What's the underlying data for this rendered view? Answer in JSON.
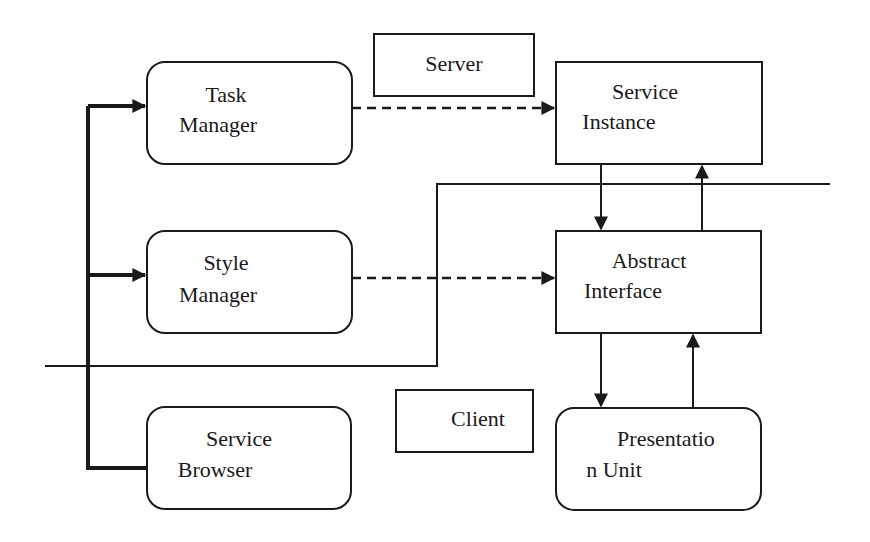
{
  "diagram": {
    "type": "client-server architecture",
    "colors": {
      "stroke": "#1a1a1a",
      "background": "#ffffff"
    },
    "zones": {
      "server_label": "Server",
      "client_label": "Client"
    },
    "nodes": {
      "task_manager": {
        "line1": "Task",
        "line2": "Manager",
        "shape": "rounded-rect"
      },
      "style_manager": {
        "line1": "Style",
        "line2": "Manager",
        "shape": "rounded-rect"
      },
      "service_browser": {
        "line1": "Service",
        "line2": "Browser",
        "shape": "rounded-rect"
      },
      "service_instance": {
        "line1": "Service",
        "line2": "Instance",
        "shape": "rect"
      },
      "abstract_interface": {
        "line1": "Abstract",
        "line2": "Interface",
        "shape": "rect"
      },
      "presentation_unit": {
        "line1": "Presentatio",
        "line2": "n Unit",
        "shape": "rounded-rect"
      }
    },
    "edges": [
      {
        "from": "service_browser",
        "to": "task_manager",
        "style": "thick-solid"
      },
      {
        "from": "service_browser",
        "to": "style_manager",
        "style": "thick-solid"
      },
      {
        "from": "task_manager",
        "to": "service_instance",
        "style": "dashed"
      },
      {
        "from": "style_manager",
        "to": "abstract_interface",
        "style": "dashed"
      },
      {
        "from": "service_instance",
        "to": "abstract_interface",
        "style": "solid"
      },
      {
        "from": "abstract_interface",
        "to": "service_instance",
        "style": "solid"
      },
      {
        "from": "abstract_interface",
        "to": "presentation_unit",
        "style": "solid"
      },
      {
        "from": "presentation_unit",
        "to": "abstract_interface",
        "style": "solid"
      }
    ]
  }
}
